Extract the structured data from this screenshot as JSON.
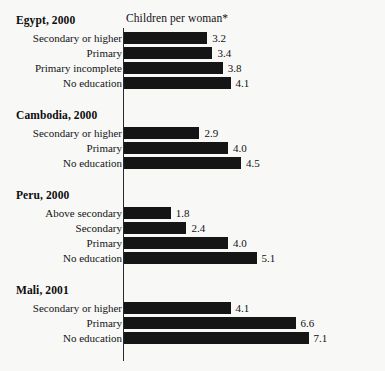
{
  "axis_title": "Children per woman*",
  "colors": {
    "background": "#f8f8f7",
    "bar": "#151515",
    "axis": "#2a2a2a",
    "text": "#111111"
  },
  "chart_data": {
    "type": "bar",
    "title": "Children per woman*",
    "xlabel": "Children per woman*",
    "ylabel": "",
    "orientation": "horizontal",
    "grid": false,
    "legend": false,
    "xlim": [
      0,
      7.1
    ],
    "px_per_unit": 26,
    "groups": [
      {
        "name": "Egypt, 2000",
        "categories": [
          "Secondary or higher",
          "Primary",
          "Primary incomplete",
          "No education"
        ],
        "values": [
          3.2,
          3.4,
          3.8,
          4.1
        ],
        "labels": [
          "3.2",
          "3.4",
          "3.8",
          "4.1"
        ]
      },
      {
        "name": "Cambodia, 2000",
        "categories": [
          "Secondary or higher",
          "Primary",
          "No education"
        ],
        "values": [
          2.9,
          4.0,
          4.5
        ],
        "labels": [
          "2.9",
          "4.0",
          "4.5"
        ]
      },
      {
        "name": "Peru, 2000",
        "categories": [
          "Above secondary",
          "Secondary",
          "Primary",
          "No education"
        ],
        "values": [
          1.8,
          2.4,
          4.0,
          5.1
        ],
        "labels": [
          "1.8",
          "2.4",
          "4.0",
          "5.1"
        ]
      },
      {
        "name": "Mali, 2001",
        "categories": [
          "Secondary or higher",
          "Primary",
          "No education"
        ],
        "values": [
          4.1,
          6.6,
          7.1
        ],
        "labels": [
          "4.1",
          "6.6",
          "7.1"
        ]
      }
    ]
  }
}
